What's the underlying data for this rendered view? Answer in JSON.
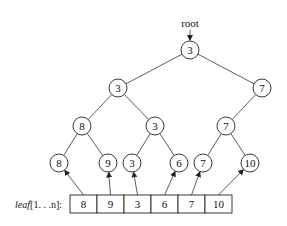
{
  "diagram": {
    "root_label": "root",
    "array_label_name": "leaf",
    "array_label_range": "[1. . .n]:",
    "array_label_n": "n",
    "tree": {
      "nodes": [
        {
          "id": "n0",
          "value": "3",
          "x": 190,
          "y": 50
        },
        {
          "id": "n1",
          "value": "3",
          "x": 118,
          "y": 88
        },
        {
          "id": "n2",
          "value": "7",
          "x": 262,
          "y": 88
        },
        {
          "id": "n3",
          "value": "8",
          "x": 82,
          "y": 126
        },
        {
          "id": "n4",
          "value": "3",
          "x": 155,
          "y": 126
        },
        {
          "id": "n5",
          "value": "7",
          "x": 226,
          "y": 126
        },
        {
          "id": "n6",
          "value": "8",
          "x": 59,
          "y": 163
        },
        {
          "id": "n7",
          "value": "9",
          "x": 108,
          "y": 163
        },
        {
          "id": "n8",
          "value": "3",
          "x": 132,
          "y": 163
        },
        {
          "id": "n9",
          "value": "6",
          "x": 179,
          "y": 163
        },
        {
          "id": "n10",
          "value": "7",
          "x": 203,
          "y": 163
        },
        {
          "id": "n11",
          "value": "10",
          "x": 250,
          "y": 163
        }
      ],
      "edges": [
        [
          "n0",
          "n1"
        ],
        [
          "n0",
          "n2"
        ],
        [
          "n1",
          "n3"
        ],
        [
          "n1",
          "n4"
        ],
        [
          "n2",
          "n5"
        ],
        [
          "n3",
          "n6"
        ],
        [
          "n3",
          "n7"
        ],
        [
          "n4",
          "n8"
        ],
        [
          "n4",
          "n9"
        ],
        [
          "n5",
          "n10"
        ],
        [
          "n5",
          "n11"
        ]
      ]
    },
    "leaf_array": {
      "values": [
        "8",
        "9",
        "3",
        "6",
        "7",
        "10"
      ],
      "x": 70,
      "y": 195,
      "cell_width": 27,
      "cell_height": 18,
      "pointers_to": [
        "n6",
        "n7",
        "n8",
        "n9",
        "n10",
        "n11"
      ]
    },
    "node_radius": 9
  }
}
